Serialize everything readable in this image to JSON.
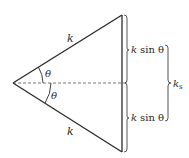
{
  "diagram": {
    "type": "geometry",
    "labels": {
      "top_side": "k",
      "bottom_side": "k",
      "upper_angle": "θ",
      "lower_angle": "θ",
      "upper_segment_k": "k",
      "upper_segment_rest": "sin θ",
      "lower_segment_k": "k",
      "lower_segment_rest": "sin θ",
      "total_k": "k",
      "total_sub": "s"
    },
    "colors": {
      "line": "#2a2a2a",
      "dashed": "#555555",
      "text": "#2a2a2a"
    }
  }
}
